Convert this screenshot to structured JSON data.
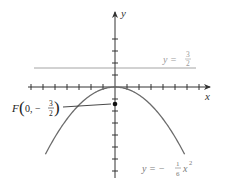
{
  "diagram": {
    "axes": {
      "x_label": "x",
      "y_label": "y",
      "unit_px": 12,
      "origin": [
        115,
        87
      ],
      "x_ticks": [
        -7,
        -6,
        -5,
        -4,
        -3,
        -2,
        -1,
        1,
        2,
        3,
        4,
        5,
        6,
        7
      ],
      "y_ticks": [
        4,
        3,
        2,
        1,
        -1,
        -2,
        -3,
        -4,
        -5,
        -6,
        -7
      ]
    },
    "parabola": {
      "equation_prefix": "y = −",
      "coef_num": "1",
      "coef_den": "6",
      "var": "x",
      "exp": "2",
      "color": "#6b6b6b"
    },
    "directrix": {
      "label_prefix": "y = ",
      "frac_num": "3",
      "frac_den": "2",
      "value": 1.5,
      "color": "#9a9a9a"
    },
    "focus": {
      "label_F": "F",
      "label_open": "0, −",
      "frac_num": "3",
      "frac_den": "2",
      "coords": [
        0,
        -1.5
      ]
    }
  }
}
